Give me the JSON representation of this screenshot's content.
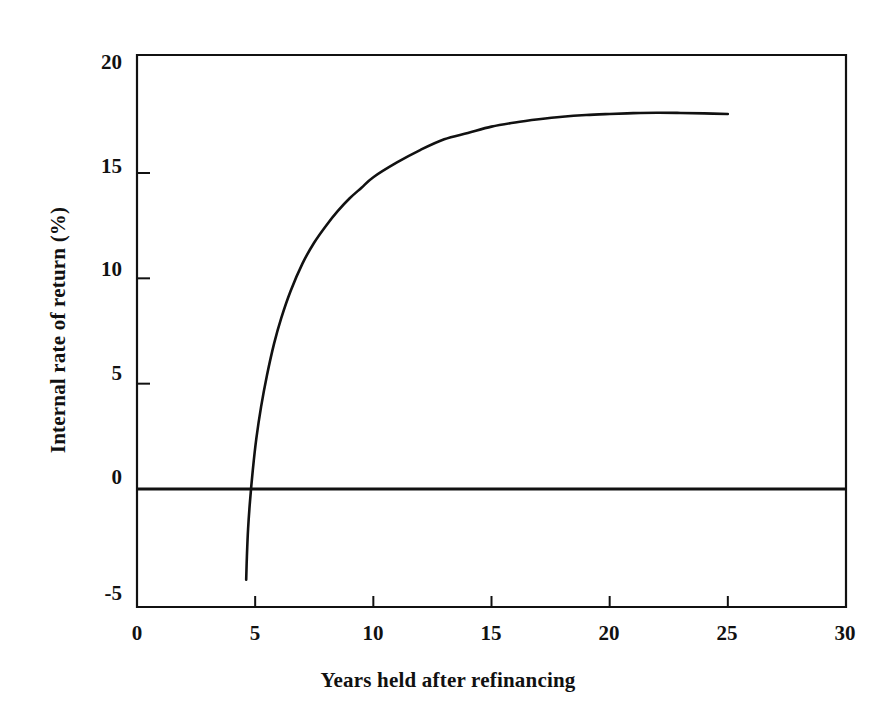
{
  "chart_data": {
    "type": "line",
    "title": "",
    "subtitle": "",
    "xlabel": "Years held after refinancing",
    "ylabel": "Internal rate of return (%)",
    "xlim": [
      0,
      30
    ],
    "ylim": [
      -5.6,
      20.6
    ],
    "xticks": [
      0,
      5,
      10,
      15,
      20,
      25,
      30
    ],
    "xticklabels": [
      "0",
      "5",
      "10",
      "15",
      "20",
      "25",
      "30"
    ],
    "yticks": [
      -5,
      0,
      5,
      10,
      15,
      20
    ],
    "yticklabels": [
      "-5",
      "0",
      "5",
      "10",
      "15",
      "20"
    ],
    "grid": false,
    "legend": null,
    "annotations": [],
    "line_color": "#111111",
    "line_width": 2.6,
    "zero_line": {
      "y": 0,
      "color": "#111111",
      "width": 3.0,
      "spans_full_width": true
    },
    "series": [
      {
        "name": "Internal rate of return",
        "x": [
          4.62,
          4.65,
          4.7,
          4.78,
          4.9,
          5.05,
          5.25,
          5.5,
          5.8,
          6.1,
          6.5,
          7.0,
          7.5,
          8.0,
          8.5,
          9.0,
          9.5,
          10.0,
          11.0,
          12.0,
          13.0,
          14.0,
          15.0,
          16.0,
          17.0,
          18.0,
          19.0,
          20.0,
          21.0,
          22.0,
          23.0,
          24.0,
          25.0
        ],
        "y": [
          -4.3,
          -3.2,
          -1.9,
          -0.6,
          0.9,
          2.4,
          3.9,
          5.4,
          6.9,
          8.1,
          9.4,
          10.7,
          11.7,
          12.5,
          13.2,
          13.8,
          14.3,
          14.8,
          15.5,
          16.1,
          16.6,
          16.9,
          17.2,
          17.4,
          17.55,
          17.67,
          17.75,
          17.8,
          17.84,
          17.86,
          17.85,
          17.83,
          17.8
        ]
      }
    ]
  },
  "axes": {
    "frame": {
      "left": 137,
      "top": 55,
      "right": 846,
      "bottom": 607
    },
    "frame_color": "#111111",
    "frame_width": 2.2,
    "tick_direction": "in",
    "tick_length": 11
  },
  "x_tick_labels": [
    {
      "label": "0",
      "px": 137
    },
    {
      "label": "5",
      "px": 255
    },
    {
      "label": "10",
      "px": 373
    },
    {
      "label": "15",
      "px": 491
    },
    {
      "label": "20",
      "px": 609
    },
    {
      "label": "25",
      "px": 727
    },
    {
      "label": "30",
      "px": 845
    }
  ],
  "y_tick_labels": [
    {
      "label": "20",
      "py": 62
    },
    {
      "label": "15",
      "py": 166
    },
    {
      "label": "10",
      "py": 269
    },
    {
      "label": "5",
      "py": 373
    },
    {
      "label": "0",
      "py": 477
    },
    {
      "label": "-5",
      "py": 593
    }
  ],
  "figure": {
    "width": 896,
    "height": 719,
    "background": "#ffffff"
  }
}
